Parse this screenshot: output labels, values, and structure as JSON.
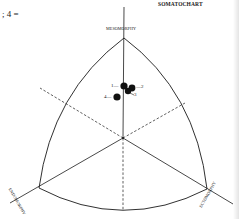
{
  "header": {
    "title": "SOMATOCHART",
    "equation_fragment": "; 4 ="
  },
  "chart": {
    "vertex_labels": {
      "top": "MESOMORPHY",
      "left": "ENDOMORPHY",
      "right": "ECTOMORPHY"
    },
    "points": [
      {
        "id": "1",
        "label": "1—"
      },
      {
        "id": "2",
        "label": "—2"
      },
      {
        "id": "3",
        "label": "3"
      },
      {
        "id": "4",
        "label": "4—"
      }
    ]
  },
  "colors": {
    "ink": "#1a1a1a",
    "background": "#ffffff"
  }
}
